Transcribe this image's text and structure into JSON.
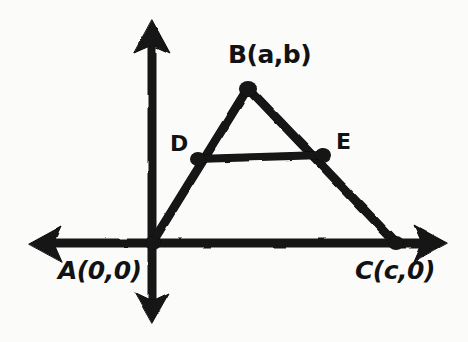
{
  "diagram": {
    "background_color": "#fbfbfa",
    "ink_color": "#121212",
    "style": "hand-drawn marker sketch",
    "labels": {
      "apex": "B(a,b)",
      "midpoint_left": "D",
      "midpoint_right": "E",
      "origin_vertex": "A(0,0)",
      "right_vertex": "C(c,0)"
    },
    "points": {
      "A": {
        "x": 152,
        "y": 243,
        "label": "A(0,0)"
      },
      "B": {
        "x": 248,
        "y": 87,
        "label": "B(a,b)"
      },
      "C": {
        "x": 395,
        "y": 243,
        "label": "C(c,0)"
      },
      "D": {
        "x": 198,
        "y": 158,
        "label": "D"
      },
      "E": {
        "x": 322,
        "y": 155,
        "label": "E"
      }
    },
    "axes": {
      "x_axis": {
        "y": 243,
        "x_start": 32,
        "x_end": 445
      },
      "y_axis": {
        "x": 152,
        "y_start": 22,
        "y_end": 320
      },
      "arrowheads": [
        "up",
        "down",
        "left",
        "right"
      ]
    },
    "segments": [
      {
        "name": "AB",
        "from": "A",
        "to": "B"
      },
      {
        "name": "BC",
        "from": "B",
        "to": "C"
      },
      {
        "name": "AC",
        "from": "A",
        "to": "C"
      },
      {
        "name": "DE",
        "from": "D",
        "to": "E"
      }
    ]
  }
}
